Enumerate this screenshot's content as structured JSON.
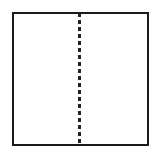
{
  "diagram": {
    "shape": "square",
    "divider": {
      "orientation": "vertical",
      "style": "dashed",
      "position": "center"
    },
    "colors": {
      "stroke": "#1a1a1a",
      "dash": "#222222",
      "fill": "#ffffff"
    }
  }
}
